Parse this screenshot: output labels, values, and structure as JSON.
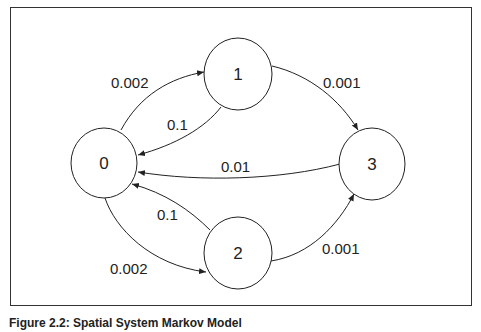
{
  "diagram": {
    "type": "markov-state-diagram",
    "nodes": [
      {
        "id": "0",
        "label": "0"
      },
      {
        "id": "1",
        "label": "1"
      },
      {
        "id": "2",
        "label": "2"
      },
      {
        "id": "3",
        "label": "3"
      }
    ],
    "edges": [
      {
        "from": "0",
        "to": "1",
        "label": "0.002"
      },
      {
        "from": "1",
        "to": "0",
        "label": "0.1"
      },
      {
        "from": "1",
        "to": "3",
        "label": "0.001"
      },
      {
        "from": "3",
        "to": "0",
        "label": "0.01"
      },
      {
        "from": "2",
        "to": "0",
        "label": "0.1"
      },
      {
        "from": "0",
        "to": "2",
        "label": "0.002"
      },
      {
        "from": "2",
        "to": "3",
        "label": "0.001"
      }
    ]
  },
  "caption": "Figure 2.2: Spatial System Markov Model",
  "colors": {
    "stroke": "#222222",
    "background": "#ffffff"
  }
}
